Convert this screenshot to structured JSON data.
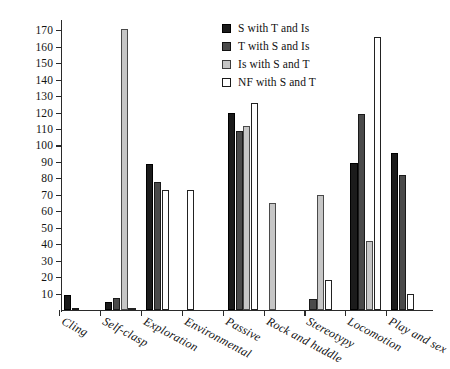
{
  "chart_data": {
    "type": "bar",
    "title": "",
    "xlabel": "",
    "ylabel": "",
    "ylim": [
      0,
      175
    ],
    "yticks": [
      10,
      20,
      30,
      40,
      50,
      60,
      70,
      80,
      90,
      100,
      110,
      120,
      130,
      140,
      150,
      160,
      170
    ],
    "grid": false,
    "legend_position": "top-right",
    "categories": [
      "Cling",
      "Self-clasp",
      "Exploration",
      "Environmental",
      "Passive",
      "Rock and huddle",
      "Stereotypy",
      "Locomotion",
      "Play and sex"
    ],
    "series": [
      {
        "name": "S with T and Is",
        "color": "#1b1b1b",
        "values": [
          9,
          5,
          89,
          0,
          120,
          0,
          0,
          89.5,
          95.5
        ]
      },
      {
        "name": "T with S and Is",
        "color": "#4a4a4a",
        "values": [
          1.5,
          7,
          77.5,
          0,
          109,
          0,
          6.5,
          119,
          82
        ]
      },
      {
        "name": "Is with S and T",
        "color": "#c6c6c6",
        "values": [
          0,
          171,
          0,
          0,
          112,
          65,
          70,
          42,
          0
        ]
      },
      {
        "name": "NF with S and T",
        "color": "#ffffff",
        "values": [
          0,
          1.5,
          73,
          73,
          126,
          0,
          18,
          166,
          10
        ]
      }
    ]
  },
  "legend": {
    "items": [
      {
        "label": "S with T and Is",
        "swatch": "black-swatch"
      },
      {
        "label": "T with S and Is",
        "swatch": "dark-gray-swatch"
      },
      {
        "label": "Is with S and T",
        "swatch": "light-gray-swatch"
      },
      {
        "label": "NF with S and T",
        "swatch": "white-swatch"
      }
    ]
  },
  "axis": {
    "y_tick_labels": [
      "10",
      "20",
      "30",
      "40",
      "50",
      "60",
      "70",
      "80",
      "90",
      "100",
      "110",
      "120",
      "130",
      "140",
      "150",
      "160",
      "170"
    ],
    "x_tick_labels": [
      "Cling",
      "Self-clasp",
      "Exploration",
      "Environmental",
      "Passive",
      "Rock and huddle",
      "Stereotypy",
      "Locomotion",
      "Play and sex"
    ]
  }
}
